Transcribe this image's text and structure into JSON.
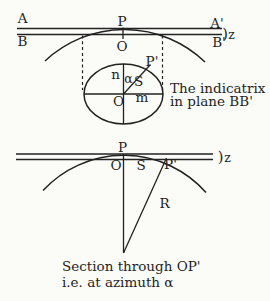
{
  "colors": {
    "background": "#fbfbf8",
    "ink": "#222220"
  },
  "top_figure": {
    "label_A": "A",
    "label_A_prime": "A'",
    "label_B": "B",
    "label_B_prime": "B'",
    "label_P": "P",
    "label_O": "O",
    "label_paren": ")",
    "label_z": "z",
    "ellipse_labels": {
      "label_n": "n",
      "label_alpha": "α",
      "label_S": "S",
      "label_P_prime": "P'",
      "label_O": "O",
      "label_m": "m"
    },
    "caption_line1": "The indicatrix",
    "caption_line2": "in plane BB'"
  },
  "bottom_figure": {
    "label_P": "P",
    "label_O": "O",
    "label_S": "S",
    "label_P_prime": "P'",
    "label_paren": ")",
    "label_z": "z",
    "label_R": "R",
    "caption_line1": "Section through OP'",
    "caption_line2": "i.e. at azimuth α"
  }
}
